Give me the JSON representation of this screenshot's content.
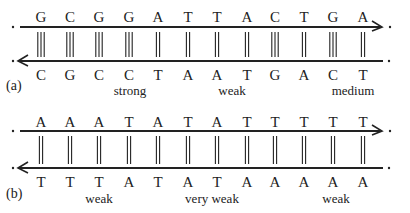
{
  "panels": [
    {
      "id": "a",
      "label": "(a)",
      "top_strand": [
        "G",
        "C",
        "G",
        "G",
        "A",
        "T",
        "T",
        "A",
        "C",
        "T",
        "G",
        "A"
      ],
      "bottom_strand": [
        "C",
        "G",
        "C",
        "C",
        "T",
        "A",
        "A",
        "T",
        "G",
        "A",
        "C",
        "T"
      ],
      "bonds": [
        3,
        3,
        3,
        3,
        2,
        2,
        2,
        2,
        3,
        2,
        3,
        2
      ],
      "regions": [
        {
          "label": "strong",
          "x": 130
        },
        {
          "label": "weak",
          "x": 232
        },
        {
          "label": "medium",
          "x": 353
        }
      ]
    },
    {
      "id": "b",
      "label": "(b)",
      "top_strand": [
        "A",
        "A",
        "A",
        "T",
        "A",
        "T",
        "A",
        "T",
        "T",
        "T",
        "T",
        "T"
      ],
      "bottom_strand": [
        "T",
        "T",
        "T",
        "A",
        "T",
        "A",
        "T",
        "A",
        "A",
        "A",
        "A",
        "A"
      ],
      "bonds": [
        2,
        2,
        2,
        2,
        2,
        2,
        2,
        2,
        2,
        2,
        2,
        2
      ],
      "regions": [
        {
          "label": "weak",
          "x": 99
        },
        {
          "label": "very weak",
          "x": 212
        },
        {
          "label": "weak",
          "x": 336
        }
      ]
    }
  ],
  "colors": {
    "ink": "#222222",
    "background": "#ffffff"
  }
}
